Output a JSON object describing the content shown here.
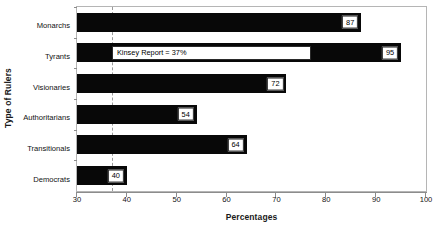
{
  "chart_data": {
    "type": "bar",
    "orientation": "horizontal",
    "title": "",
    "xlabel": "Percentages",
    "ylabel": "Type of Rulers",
    "categories": [
      "Monarchs",
      "Tyrants",
      "Visionaries",
      "Authoritarians",
      "Transitionals",
      "Democrats"
    ],
    "values": [
      87,
      95,
      72,
      54,
      64,
      40
    ],
    "xlim": [
      30,
      100
    ],
    "xticks": [
      30,
      40,
      50,
      60,
      70,
      80,
      90,
      100
    ],
    "xtick_labels": [
      "30",
      "40",
      "50",
      "60",
      "70",
      "80",
      "90",
      "100"
    ],
    "grid": false,
    "legend": null,
    "bar_color": "#080808",
    "reference_line": {
      "value": 37,
      "style": "dashed",
      "color": "#9a9a9a",
      "label": "Kinsey Report = 37%"
    },
    "annotations": [
      {
        "text": "Kinsey Report = 37%",
        "attached_to": "Tyrants",
        "x_start": 37,
        "x_end": 77
      }
    ],
    "data_labels": [
      "87",
      "95",
      "72",
      "54",
      "64",
      "40"
    ]
  }
}
